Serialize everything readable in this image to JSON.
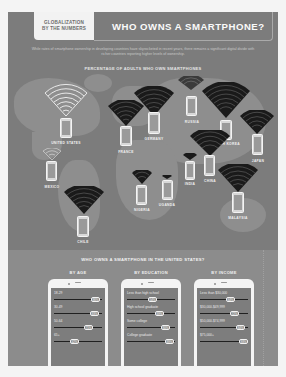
{
  "header": {
    "tag_line1": "GLOBALIZATION",
    "tag_line2": "BY THE NUMBERS",
    "title": "WHO OWNS A SMARTPHONE?"
  },
  "intro": "While rates of smartphone ownership in developing countries have skyrocketed in recent years, there remains a significant digital divide with richer countries reporting higher levels of ownership.",
  "map": {
    "title": "PERCENTAGE OF ADULTS WHO OWN SMARTPHONES",
    "countries": [
      {
        "name": "UNITED STATES"
      },
      {
        "name": "FRANCE"
      },
      {
        "name": "GERMANY"
      },
      {
        "name": "RUSSIA"
      },
      {
        "name": "SOUTH KOREA"
      },
      {
        "name": "JAPAN"
      },
      {
        "name": "CHINA"
      },
      {
        "name": "INDIA"
      },
      {
        "name": "MEXICO"
      },
      {
        "name": "CHILE"
      },
      {
        "name": "NIGERIA"
      },
      {
        "name": "UGANDA"
      },
      {
        "name": "MALAYSIA"
      }
    ]
  },
  "us": {
    "title": "WHO OWNS A SMARTPHONE IN THE UNITED STATES?",
    "columns": [
      {
        "header": "BY AGE",
        "rows": [
          {
            "label": "18-29",
            "value": "86%"
          },
          {
            "label": "30-49",
            "value": "83%"
          },
          {
            "label": "50-64",
            "value": "71%"
          },
          {
            "label": "65+",
            "value": "42%"
          }
        ]
      },
      {
        "header": "BY EDUCATION",
        "rows": [
          {
            "label": "Less than high school",
            "value": "54%"
          },
          {
            "label": "High school graduate",
            "value": "69%"
          },
          {
            "label": "Some college",
            "value": "80%"
          },
          {
            "label": "College graduate",
            "value": "89%"
          }
        ]
      },
      {
        "header": "BY INCOME",
        "rows": [
          {
            "label": "Less than $30,000",
            "value": "64%"
          },
          {
            "label": "$30,000-$49,999",
            "value": "72%"
          },
          {
            "label": "$50,000-$74,999",
            "value": "84%"
          },
          {
            "label": "$75,000+",
            "value": "93%"
          }
        ]
      }
    ]
  },
  "colors": {
    "panel": "#7c7c7c",
    "land": "#8e8e8e",
    "us_section": "#8c8c8c",
    "fan_light": "#f2f2f2",
    "fan_dark": "#1a1a1a"
  }
}
